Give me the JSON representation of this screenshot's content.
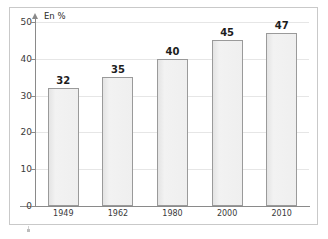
{
  "chart_data": {
    "type": "bar",
    "title": "",
    "subtitle": "",
    "xlabel": "",
    "ylabel": "En %",
    "categories": [
      "1949",
      "1962",
      "1980",
      "2000",
      "2010"
    ],
    "values": [
      32,
      35,
      40,
      45,
      47
    ],
    "value_labels": [
      "32",
      "35",
      "40",
      "45",
      "47"
    ],
    "ylim": [
      0,
      50
    ],
    "ytick_labels": [
      "0",
      "10",
      "20",
      "30",
      "40",
      "50"
    ],
    "ytick_values": [
      0,
      10,
      20,
      30,
      40,
      50
    ],
    "grid": "horizontal",
    "legend": "none",
    "series": [
      {
        "name": "En %",
        "values": [
          32,
          35,
          40,
          45,
          47
        ]
      }
    ],
    "colors": {
      "bar_fill": "#ededed",
      "bar_border": "#9a9a9a",
      "gridline": "#e6e6e6",
      "axis": "#8a8a8a",
      "text": "#1d1d1d",
      "frame": "#c9c9c9",
      "background": "#ffffff"
    }
  }
}
